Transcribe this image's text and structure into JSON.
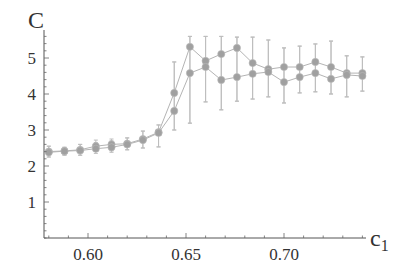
{
  "chart_data": {
    "type": "line",
    "title": "",
    "xlabel": "c1",
    "ylabel": "C",
    "xlim": [
      0.5776,
      0.742
    ],
    "ylim": [
      0,
      5.6
    ],
    "x_ticks": [
      0.6,
      0.65,
      0.7
    ],
    "x_tick_labels": [
      "0.60",
      "0.65",
      "0.70"
    ],
    "y_ticks": [
      1,
      2,
      3,
      4,
      5
    ],
    "y_tick_labels": [
      "1",
      "2",
      "3",
      "4",
      "5"
    ],
    "grid": false,
    "legend": null,
    "error_bars": true,
    "marker_color": "#a0a0a0",
    "line_color": "#b4b4b4",
    "x": [
      0.58,
      0.588,
      0.596,
      0.604,
      0.612,
      0.62,
      0.628,
      0.636,
      0.644,
      0.652,
      0.66,
      0.668,
      0.676,
      0.684,
      0.692,
      0.7,
      0.708,
      0.716,
      0.724,
      0.732,
      0.74
    ],
    "series": [
      {
        "name": "series 1",
        "values": [
          2.4,
          2.42,
          2.45,
          2.55,
          2.6,
          2.62,
          2.75,
          2.94,
          4.03,
          5.31,
          4.92,
          5.11,
          5.28,
          4.86,
          4.69,
          4.75,
          4.75,
          4.89,
          4.75,
          4.58,
          4.58
        ],
        "err_low": [
          2.25,
          2.3,
          2.3,
          2.4,
          2.42,
          2.45,
          2.5,
          2.53,
          3.0,
          3.19,
          3.78,
          3.56,
          3.8,
          3.86,
          3.92,
          3.75,
          4.03,
          4.06,
          4.0,
          3.92,
          4.08
        ],
        "err_high": [
          2.55,
          2.52,
          2.6,
          2.72,
          2.75,
          2.78,
          2.97,
          3.14,
          4.89,
          5.6,
          5.6,
          5.6,
          5.58,
          5.58,
          5.5,
          5.28,
          5.33,
          5.39,
          5.47,
          5.06,
          5.03
        ]
      },
      {
        "name": "series 2",
        "values": [
          2.38,
          2.41,
          2.43,
          2.48,
          2.52,
          2.6,
          2.72,
          2.92,
          3.53,
          4.58,
          4.75,
          4.39,
          4.47,
          4.56,
          4.61,
          4.33,
          4.47,
          4.58,
          4.42,
          4.53,
          4.5
        ],
        "err_low": [
          2.25,
          2.3,
          2.3,
          2.35,
          2.38,
          2.45,
          2.5,
          2.53,
          3.0,
          3.19,
          3.78,
          3.56,
          3.8,
          3.86,
          3.92,
          3.75,
          4.03,
          4.06,
          4.0,
          3.92,
          4.08
        ],
        "err_high": [
          2.55,
          2.52,
          2.6,
          2.65,
          2.7,
          2.78,
          2.97,
          3.14,
          4.89,
          5.6,
          5.6,
          5.6,
          5.58,
          5.58,
          5.5,
          5.28,
          5.33,
          5.39,
          5.47,
          5.06,
          5.03
        ]
      }
    ],
    "layout": {
      "x_axis_px": [
        44,
        366
      ],
      "y_axis_px": 238,
      "x_origin_value": 0.6,
      "x_origin_px": 88,
      "px_per_x_unit": 1960,
      "px_per_y_unit": 36
    }
  }
}
